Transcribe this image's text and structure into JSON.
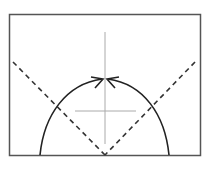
{
  "diagram": {
    "type": "trajectory-diagram",
    "width": 212,
    "height": 169,
    "frame": {
      "x": 9,
      "y": 14,
      "width": 191,
      "height": 141,
      "stroke": "#555555"
    },
    "axes": {
      "vertical": {
        "x": 105,
        "y1": 32,
        "y2": 144,
        "stroke": "#aaaaaa"
      },
      "horizontal": {
        "y": 111,
        "x1": 75,
        "x2": 136,
        "stroke": "#aaaaaa"
      }
    },
    "arc": {
      "stroke": "#222222",
      "left_start": {
        "x": 40,
        "y": 155
      },
      "right_start": {
        "x": 169,
        "y": 155
      },
      "apex": {
        "x": 105,
        "y": 79
      }
    },
    "dashed_lines": [
      {
        "from": {
          "x": 13,
          "y": 62
        },
        "to": {
          "x": 105,
          "y": 155
        }
      },
      {
        "from": {
          "x": 195,
          "y": 62
        },
        "to": {
          "x": 105,
          "y": 155
        }
      }
    ],
    "arrows": [
      {
        "direction": "right",
        "tip": {
          "x": 104,
          "y": 79
        }
      },
      {
        "direction": "left",
        "tip": {
          "x": 106,
          "y": 79
        }
      }
    ]
  }
}
